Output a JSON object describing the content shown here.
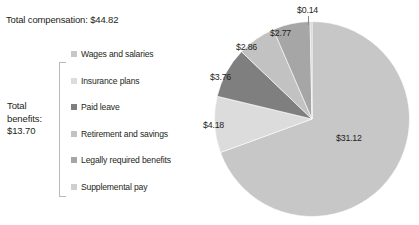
{
  "header": {
    "total_compensation_text": "Total compensation: $44.82"
  },
  "benefits_group": {
    "label_text": "Total benefits: $13.70"
  },
  "legend": {
    "items": [
      {
        "label": "Wages and salaries",
        "color": "#c7c7c7"
      },
      {
        "label": "Insurance plans",
        "color": "#dcdcdc"
      },
      {
        "label": "Paid leave",
        "color": "#7f7f7f"
      },
      {
        "label": "Retirement and savings",
        "color": "#c2c2c2"
      },
      {
        "label": "Legally required benefits",
        "color": "#a6a6a6"
      },
      {
        "label": "Supplemental pay",
        "color": "#cfcfcf"
      }
    ]
  },
  "labels": {
    "wages": "$31.12",
    "insurance": "$4.18",
    "paid_leave": "$3.76",
    "retirement": "$2.86",
    "legally_required": "$2.77",
    "supplemental": "$0.14"
  },
  "chart_data": {
    "type": "pie",
    "title": "",
    "categories": [
      "Wages and salaries",
      "Insurance plans",
      "Paid leave",
      "Retirement and savings",
      "Legally required benefits",
      "Supplemental pay"
    ],
    "values": [
      31.12,
      4.18,
      3.76,
      2.86,
      2.77,
      0.14
    ],
    "value_labels": [
      "$31.12",
      "$4.18",
      "$3.76",
      "$2.86",
      "$2.77",
      "$0.14"
    ],
    "colors": [
      "#c7c7c7",
      "#dcdcdc",
      "#7f7f7f",
      "#c2c2c2",
      "#a6a6a6",
      "#cfcfcf"
    ],
    "total": 44.82,
    "total_label": "$44.82",
    "benefits_subtotal": 13.7,
    "benefits_subtotal_label": "$13.70",
    "units": "USD per hour",
    "start_angle_deg": 0,
    "direction": "clockwise",
    "legend_position": "left",
    "grid": false
  }
}
